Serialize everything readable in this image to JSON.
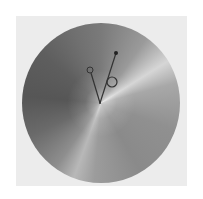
{
  "figure": {
    "background_color": "#ffffff",
    "panel_color": "#ececec",
    "dial": {
      "shape": "circle",
      "shading": "grayscale conic gradient",
      "center": [
        101,
        103
      ],
      "colors": {
        "dark": "#565656",
        "mid": "#7a7a7a",
        "highlight": "#d6d6d6"
      }
    },
    "handles": [
      {
        "name": "left-arm",
        "from": [
          100,
          103
        ],
        "to": [
          90,
          70
        ],
        "end_marker": "small-open-circle",
        "marker_radius": 3
      },
      {
        "name": "right-arm",
        "from": [
          100,
          103
        ],
        "to": [
          116,
          53
        ],
        "end_marker": "filled-dot",
        "marker_radius": 2,
        "mid_marker": {
          "type": "open-circle",
          "at": [
            112,
            82
          ],
          "radius": 5
        }
      }
    ],
    "line_color": "#333333"
  }
}
